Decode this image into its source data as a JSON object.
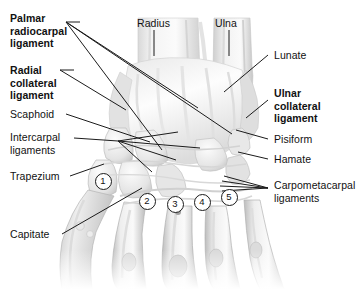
{
  "figure": {
    "kind": "anatomical-illustration",
    "background_color": "#ffffff",
    "line_color": "#1b1b1b",
    "text_color": "#111111"
  },
  "labels_left": [
    {
      "name": "palmar-radiocarpal-ligament",
      "text": "Palmar\nradiocarpal\nligament",
      "bold": true,
      "x": 10,
      "y": 12
    },
    {
      "name": "radial-collateral-ligament",
      "text": "Radial\ncollateral\nligament",
      "bold": true,
      "x": 10,
      "y": 64
    },
    {
      "name": "scaphoid",
      "text": "Scaphoid",
      "bold": false,
      "x": 10,
      "y": 110
    },
    {
      "name": "intercarpal-ligaments",
      "text": "Intercarpal\nligaments",
      "bold": false,
      "x": 10,
      "y": 133
    },
    {
      "name": "trapezium",
      "text": "Trapezium",
      "bold": false,
      "x": 10,
      "y": 172
    },
    {
      "name": "capitate",
      "text": "Capitate",
      "bold": false,
      "x": 10,
      "y": 231
    }
  ],
  "labels_top": [
    {
      "name": "radius",
      "text": "Radius",
      "bold": false,
      "x": 137,
      "y": 17
    },
    {
      "name": "ulna",
      "text": "Ulna",
      "bold": false,
      "x": 215,
      "y": 17
    }
  ],
  "labels_right": [
    {
      "name": "lunate",
      "text": "Lunate",
      "bold": false,
      "x": 272,
      "y": 51
    },
    {
      "name": "ulnar-collateral-ligament",
      "text": "Ulnar\ncollateral\nligament",
      "bold": true,
      "x": 272,
      "y": 89
    },
    {
      "name": "pisiform",
      "text": "Pisiform",
      "bold": false,
      "x": 272,
      "y": 135
    },
    {
      "name": "hamate",
      "text": "Hamate",
      "bold": false,
      "x": 272,
      "y": 155
    },
    {
      "name": "carpometacarpal-ligaments",
      "text": "Carpometacarpal\nligaments",
      "bold": false,
      "x": 272,
      "y": 180
    }
  ],
  "numbered_markers": [
    {
      "label": "1",
      "x": 102,
      "y": 180
    },
    {
      "label": "2",
      "x": 146,
      "y": 200
    },
    {
      "label": "3",
      "x": 174,
      "y": 203
    },
    {
      "label": "4",
      "x": 201,
      "y": 201
    },
    {
      "label": "5",
      "x": 228,
      "y": 196
    }
  ]
}
